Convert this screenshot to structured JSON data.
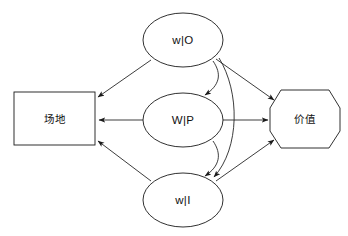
{
  "diagram": {
    "title": "",
    "background_color": "#ffffff",
    "stroke_color": "#1a1a1a",
    "nodes": [
      {
        "id": "site",
        "label": "场地",
        "shape": "rectangle",
        "x": 14,
        "y": 92,
        "width": 81,
        "height": 53
      },
      {
        "id": "wo",
        "label": "w|O",
        "shape": "ellipse",
        "cx": 183,
        "cy": 40,
        "rx": 40,
        "ry": 27
      },
      {
        "id": "wp",
        "label": "W|P",
        "shape": "ellipse",
        "cx": 183,
        "cy": 120,
        "rx": 40,
        "ry": 27
      },
      {
        "id": "wi",
        "label": "w|I",
        "shape": "ellipse",
        "cx": 183,
        "cy": 200,
        "rx": 40,
        "ry": 27
      },
      {
        "id": "value",
        "label": "价值",
        "shape": "octagon",
        "cx": 305,
        "cy": 119,
        "rx": 35,
        "ry": 29
      }
    ],
    "edges": [
      {
        "from": "wo",
        "to": "site",
        "style": "straight",
        "arrow": "end"
      },
      {
        "from": "wp",
        "to": "site",
        "style": "straight",
        "arrow": "end"
      },
      {
        "from": "wi",
        "to": "site",
        "style": "straight",
        "arrow": "end"
      },
      {
        "from": "wo",
        "to": "wp",
        "style": "curved",
        "arrow": "end"
      },
      {
        "from": "wp",
        "to": "wi",
        "style": "curved",
        "arrow": "end"
      },
      {
        "from": "wo",
        "to": "wi",
        "style": "curved",
        "arrow": "end"
      },
      {
        "from": "wo",
        "to": "value",
        "style": "straight",
        "arrow": "end"
      },
      {
        "from": "wp",
        "to": "value",
        "style": "straight",
        "arrow": "end"
      },
      {
        "from": "wi",
        "to": "value",
        "style": "straight",
        "arrow": "end"
      }
    ]
  }
}
